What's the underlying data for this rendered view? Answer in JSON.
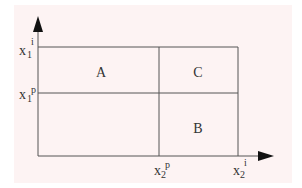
{
  "diagram": {
    "regions": [
      {
        "id": "A",
        "label": "A"
      },
      {
        "id": "B",
        "label": "B"
      },
      {
        "id": "C",
        "label": "C"
      }
    ],
    "y_ticks": [
      {
        "base": "x",
        "sub": "1",
        "sup": "i"
      },
      {
        "base": "x",
        "sub": "1",
        "sup": "p"
      }
    ],
    "x_ticks": [
      {
        "base": "x",
        "sub": "2",
        "sup": "p"
      },
      {
        "base": "x",
        "sub": "2",
        "sup": "i"
      }
    ]
  }
}
